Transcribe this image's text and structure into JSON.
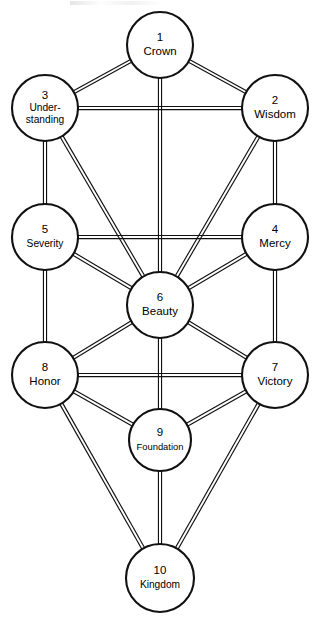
{
  "diagram": {
    "type": "node-link-diagram",
    "canvas": {
      "width": 319,
      "height": 623,
      "background": "#ffffff"
    },
    "style": {
      "line_color": "#111111",
      "node_fill": "#ffffff",
      "node_stroke": "#111111",
      "edge_rendering": "double-stroke-parallel-lines",
      "edge_gap": 3.1,
      "node_stroke_width": 2.1,
      "edge_stroke_width": 1.15
    },
    "nodes": [
      {
        "id": 1,
        "number": "1",
        "label": "Crown",
        "label_lines": [
          "Crown"
        ],
        "cx": 160,
        "cy": 45,
        "r": 33
      },
      {
        "id": 2,
        "number": "2",
        "label": "Wisdom",
        "label_lines": [
          "Wisdom"
        ],
        "cx": 275,
        "cy": 108,
        "r": 33
      },
      {
        "id": 3,
        "number": "3",
        "label": "Understanding",
        "label_lines": [
          "Under-",
          "standing"
        ],
        "cx": 45,
        "cy": 108,
        "r": 33
      },
      {
        "id": 4,
        "number": "4",
        "label": "Mercy",
        "label_lines": [
          "Mercy"
        ],
        "cx": 275,
        "cy": 237,
        "r": 33
      },
      {
        "id": 5,
        "number": "5",
        "label": "Severity",
        "label_lines": [
          "Severity"
        ],
        "cx": 45,
        "cy": 237,
        "r": 33
      },
      {
        "id": 6,
        "number": "6",
        "label": "Beauty",
        "label_lines": [
          "Beauty"
        ],
        "cx": 160,
        "cy": 305,
        "r": 33
      },
      {
        "id": 7,
        "number": "7",
        "label": "Victory",
        "label_lines": [
          "Victory"
        ],
        "cx": 275,
        "cy": 375,
        "r": 33
      },
      {
        "id": 8,
        "number": "8",
        "label": "Honor",
        "label_lines": [
          "Honor"
        ],
        "cx": 45,
        "cy": 375,
        "r": 33
      },
      {
        "id": 9,
        "number": "9",
        "label": "Foundation",
        "label_lines": [
          "Foundation"
        ],
        "cx": 160,
        "cy": 440,
        "r": 31
      },
      {
        "id": 10,
        "number": "10",
        "label": "Kingdom",
        "label_lines": [
          "Kingdom"
        ],
        "cx": 160,
        "cy": 578,
        "r": 34
      }
    ],
    "edges": [
      {
        "from": 1,
        "to": 2
      },
      {
        "from": 1,
        "to": 3
      },
      {
        "from": 1,
        "to": 6
      },
      {
        "from": 2,
        "to": 3
      },
      {
        "from": 2,
        "to": 4
      },
      {
        "from": 2,
        "to": 6
      },
      {
        "from": 3,
        "to": 5
      },
      {
        "from": 3,
        "to": 6
      },
      {
        "from": 4,
        "to": 5
      },
      {
        "from": 4,
        "to": 6
      },
      {
        "from": 4,
        "to": 7
      },
      {
        "from": 5,
        "to": 6
      },
      {
        "from": 5,
        "to": 8
      },
      {
        "from": 6,
        "to": 7
      },
      {
        "from": 6,
        "to": 8
      },
      {
        "from": 6,
        "to": 9
      },
      {
        "from": 7,
        "to": 8
      },
      {
        "from": 7,
        "to": 9
      },
      {
        "from": 7,
        "to": 10
      },
      {
        "from": 8,
        "to": 9
      },
      {
        "from": 8,
        "to": 10
      },
      {
        "from": 9,
        "to": 10
      }
    ],
    "edge_count": 22,
    "node_count": 10
  }
}
